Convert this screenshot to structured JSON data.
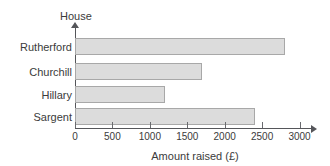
{
  "chart_data": {
    "type": "bar",
    "orientation": "horizontal",
    "title": "",
    "xlabel": "Amount raised (£)",
    "ylabel": "House",
    "categories": [
      "Rutherford",
      "Churchill",
      "Hillary",
      "Sargent"
    ],
    "values": [
      2800,
      1700,
      1200,
      2400
    ],
    "xlim": [
      0,
      3000
    ],
    "xticks": [
      0,
      500,
      1000,
      1500,
      2000,
      2500,
      3000
    ],
    "xtick_labels": [
      "0",
      "500",
      "1000",
      "1500",
      "2000",
      "2500",
      "3000"
    ],
    "grid": false,
    "legend": null,
    "bar_fill_color": "#dcdcdc",
    "bar_border_color": "#a8a8a8",
    "axis_color": "#55565a",
    "text_color": "#3b3b3b",
    "background_color": "#ffffff"
  }
}
